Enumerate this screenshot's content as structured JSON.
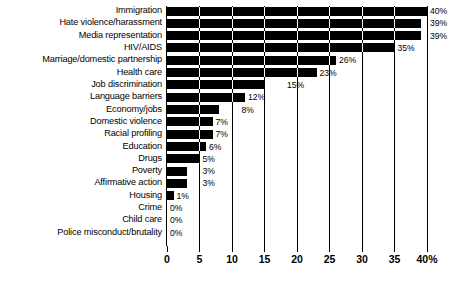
{
  "chart_data": {
    "type": "bar",
    "orientation": "horizontal",
    "title": "",
    "subtitle": "",
    "xlabel": "",
    "ylabel": "",
    "xlim": [
      0,
      40
    ],
    "grid": true,
    "legend": null,
    "xticks": [
      {
        "value": 0,
        "label": "0"
      },
      {
        "value": 5,
        "label": "5"
      },
      {
        "value": 10,
        "label": "10"
      },
      {
        "value": 15,
        "label": "15"
      },
      {
        "value": 20,
        "label": "20"
      },
      {
        "value": 25,
        "label": "25"
      },
      {
        "value": 30,
        "label": "30"
      },
      {
        "value": 35,
        "label": "35"
      },
      {
        "value": 40,
        "label": "40%"
      }
    ],
    "bar_color": "#000000",
    "categories": [
      "Immigration",
      "Hate violence/harassment",
      "Media representation",
      "HIV/AIDS",
      "Marriage/domestic partnership",
      "Health care",
      "Job discrimination",
      "Language barriers",
      "Economy/jobs",
      "Domestic violence",
      "Racial profiling",
      "Education",
      "Drugs",
      "Poverty",
      "Affirmative action",
      "Housing",
      "Crime",
      "Child care",
      "Police misconduct/brutality"
    ],
    "values": [
      40,
      39,
      39,
      35,
      26,
      23,
      15,
      12,
      8,
      7,
      7,
      6,
      5,
      3,
      3,
      1,
      0,
      0,
      0
    ],
    "value_labels": [
      "40%",
      "39%",
      "39%",
      "35%",
      "26%",
      "23%",
      "15%",
      "12%",
      "8%",
      "7%",
      "7%",
      "6%",
      "5%",
      "3%",
      "3%",
      "1%",
      "0%",
      "0%",
      "0%"
    ],
    "label_x": [
      40,
      40,
      40,
      35,
      26,
      23,
      18,
      12,
      11,
      7,
      7,
      6,
      5,
      5,
      5,
      1,
      0,
      0,
      0
    ]
  },
  "caption": {
    "text": ""
  }
}
